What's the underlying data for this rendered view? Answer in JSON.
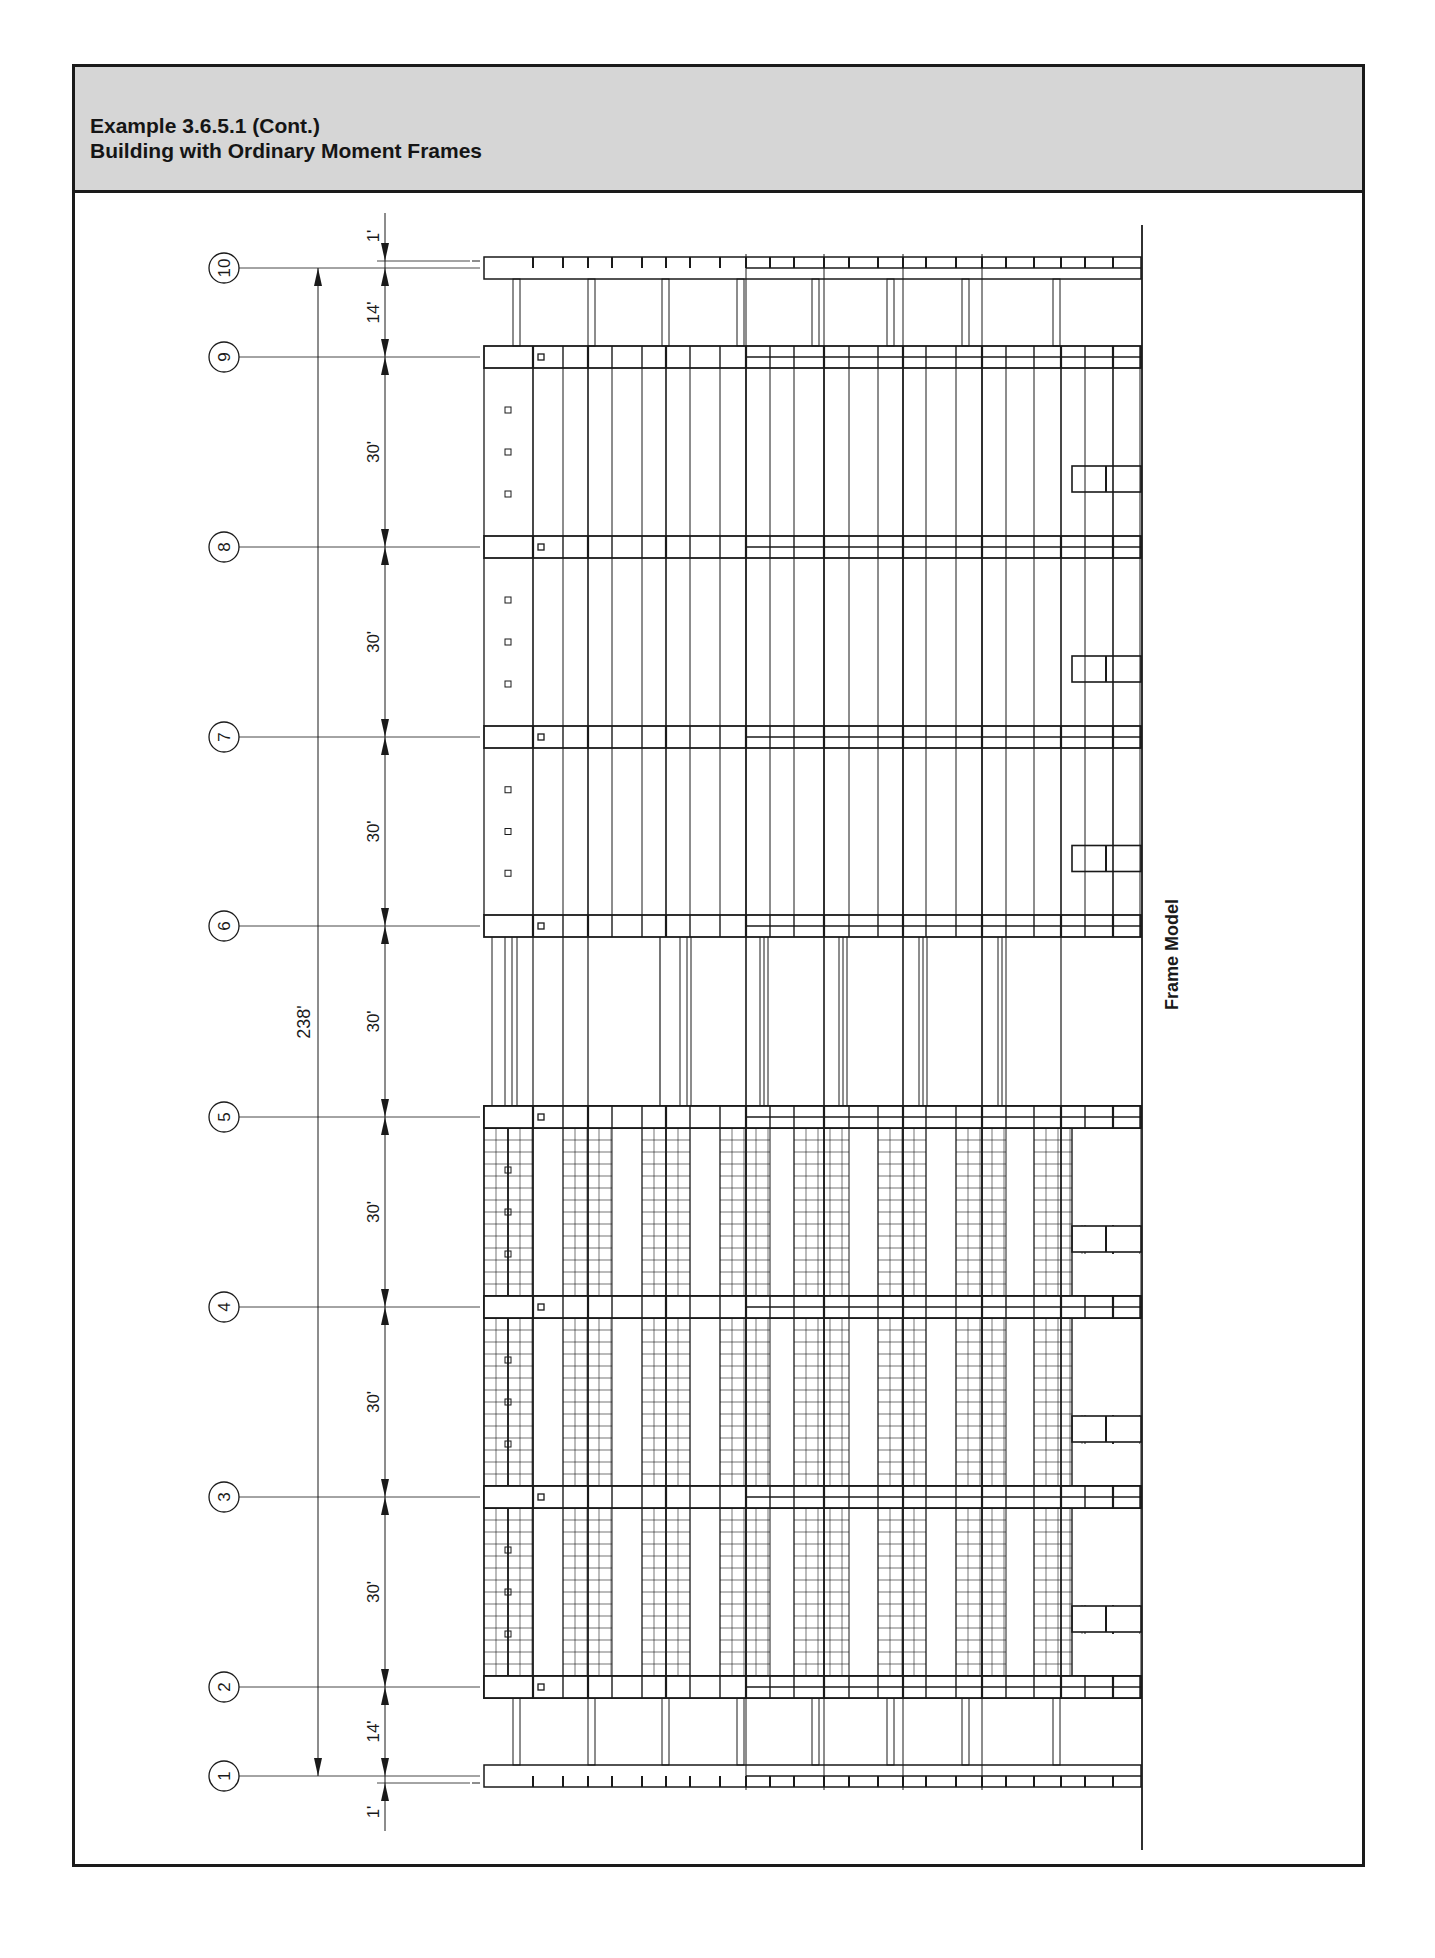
{
  "header": {
    "line1": "Example 3.6.5.1 (Cont.)",
    "line2": "Building with Ordinary Moment Frames"
  },
  "figure": {
    "caption": "Frame Model",
    "total_dimension": "238'",
    "grid_lines": [
      {
        "label": "10",
        "y": 268
      },
      {
        "label": "9",
        "y": 357
      },
      {
        "label": "8",
        "y": 547
      },
      {
        "label": "7",
        "y": 737
      },
      {
        "label": "6",
        "y": 926
      },
      {
        "label": "5",
        "y": 1117
      },
      {
        "label": "4",
        "y": 1307
      },
      {
        "label": "3",
        "y": 1497
      },
      {
        "label": "2",
        "y": 1687
      },
      {
        "label": "1",
        "y": 1776
      }
    ],
    "dimensions": [
      {
        "label": "1'",
        "position": "top"
      },
      {
        "label": "14'",
        "between": [
          "10",
          "9"
        ]
      },
      {
        "label": "30'",
        "between": [
          "9",
          "8"
        ]
      },
      {
        "label": "30'",
        "between": [
          "8",
          "7"
        ]
      },
      {
        "label": "30'",
        "between": [
          "7",
          "6"
        ]
      },
      {
        "label": "30'",
        "between": [
          "6",
          "5"
        ]
      },
      {
        "label": "30'",
        "between": [
          "5",
          "4"
        ]
      },
      {
        "label": "30'",
        "between": [
          "4",
          "3"
        ]
      },
      {
        "label": "30'",
        "between": [
          "3",
          "2"
        ]
      },
      {
        "label": "14'",
        "between": [
          "2",
          "1"
        ]
      },
      {
        "label": "1'",
        "position": "bottom"
      }
    ]
  },
  "colors": {
    "header_bg": "#d6d6d6",
    "line": "#1a1a1a",
    "background": "#ffffff"
  }
}
